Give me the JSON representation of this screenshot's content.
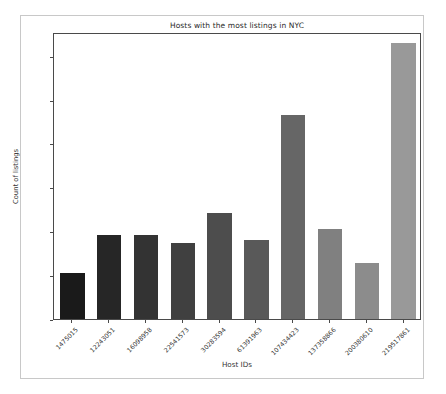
{
  "figure": {
    "background_color": "#ffffff",
    "frame_color": "#c8c8c8",
    "axis_color": "#4a4a4a"
  },
  "chart_data": {
    "type": "bar",
    "title": "Hosts with the most listings in NYC",
    "xlabel": "Host IDs",
    "ylabel": "Count of listings",
    "categories": [
      "1475015",
      "12243051",
      "16098958",
      "22541573",
      "30283594",
      "61391963",
      "107434423",
      "137358866",
      "200380610",
      "219517861"
    ],
    "values": [
      52,
      96,
      96,
      87,
      121,
      90,
      232,
      102,
      64,
      315
    ],
    "bar_colors": [
      "#1a1a1a",
      "#262626",
      "#333333",
      "#404040",
      "#4d4d4d",
      "#595959",
      "#666666",
      "#808080",
      "#8c8c8c",
      "#999999"
    ],
    "ylim": [
      0,
      327
    ],
    "yticks": [
      0,
      50,
      100,
      150,
      200,
      250,
      300
    ],
    "ytick_labels": [
      "0",
      "50",
      "100",
      "150",
      "200",
      "250",
      "300"
    ],
    "grid": false,
    "legend": null,
    "xtick_rotation": -45
  }
}
